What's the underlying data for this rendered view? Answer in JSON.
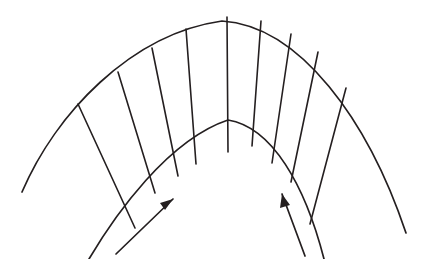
{
  "figure": {
    "background_color": "#ffffff",
    "line_color": "#241f20",
    "canvas": {
      "width": 434,
      "height": 259
    }
  },
  "geometry": {
    "center": {
      "x": 228,
      "y": 259
    },
    "outer_arc": {
      "name": "outer-wall-arc",
      "apex": {
        "x": 222,
        "y": 20
      },
      "left_end": {
        "x": 22,
        "y": 192
      },
      "right_end": {
        "x": 406,
        "y": 233
      },
      "path": "M 22 192 C 55 115, 130 34, 222 21 C 300 26, 368 120, 406 233"
    },
    "inner_arc": {
      "name": "inner-wall-arc",
      "apex": {
        "x": 228,
        "y": 119
      },
      "left_tail_end": {
        "x": 89,
        "y": 259
      },
      "right_tail_end": {
        "x": 324,
        "y": 259
      },
      "path": "M 89 259 C 115 215, 168 140, 228 120 C 272 127, 305 185, 324 259"
    },
    "radial_lines": [
      {
        "name": "radial-1",
        "outer": {
          "x": 78,
          "y": 104
        },
        "inner": {
          "x": 135,
          "y": 228
        }
      },
      {
        "name": "radial-2",
        "outer": {
          "x": 118,
          "y": 72
        },
        "inner": {
          "x": 155,
          "y": 193
        }
      },
      {
        "name": "radial-3",
        "outer": {
          "x": 152,
          "y": 48
        },
        "inner": {
          "x": 178,
          "y": 176
        }
      },
      {
        "name": "radial-4",
        "outer": {
          "x": 186,
          "y": 29
        },
        "inner": {
          "x": 196,
          "y": 164
        }
      },
      {
        "name": "radial-5",
        "outer": {
          "x": 227,
          "y": 17
        },
        "inner": {
          "x": 228,
          "y": 152
        }
      },
      {
        "name": "radial-6",
        "outer": {
          "x": 261,
          "y": 21
        },
        "inner": {
          "x": 252,
          "y": 146
        }
      },
      {
        "name": "radial-7",
        "outer": {
          "x": 291,
          "y": 34
        },
        "inner": {
          "x": 272,
          "y": 163
        }
      },
      {
        "name": "radial-8",
        "outer": {
          "x": 318,
          "y": 52
        },
        "inner": {
          "x": 291,
          "y": 182
        }
      },
      {
        "name": "radial-9",
        "outer": {
          "x": 346,
          "y": 88
        },
        "inner": {
          "x": 310,
          "y": 224
        }
      }
    ],
    "flow_arrows": [
      {
        "name": "inlet-flow-arrow-left",
        "direction": "up-right",
        "tail": {
          "x": 116,
          "y": 254
        },
        "tip": {
          "x": 173,
          "y": 199
        },
        "head_points": "173,199 160,203 165,210"
      },
      {
        "name": "inlet-flow-arrow-right",
        "direction": "up-left",
        "tail": {
          "x": 305,
          "y": 256
        },
        "tip": {
          "x": 282,
          "y": 194
        },
        "head_points": "282,194 280,208 290,205"
      }
    ]
  }
}
